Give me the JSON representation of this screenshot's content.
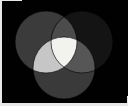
{
  "figure": {
    "name": "three-circle-venn-diagram",
    "background_color": "#010101",
    "page_color": "#ffffff",
    "border_color": "#e8e8e8",
    "width": 128,
    "height": 106
  },
  "chart_data": {
    "type": "venn",
    "title": "",
    "subtitle": "",
    "xlabel": "",
    "ylabel": "",
    "grid": false,
    "legend": "none",
    "background": "#010101",
    "sets": [
      {
        "id": "A",
        "label": "",
        "position": "top-left",
        "cx": 46,
        "cy": 42,
        "r": 31,
        "color": "#3b3b3b"
      },
      {
        "id": "B",
        "label": "",
        "position": "top-right",
        "cx": 82,
        "cy": 42,
        "r": 31,
        "color": "#141414"
      },
      {
        "id": "C",
        "label": "",
        "position": "bottom-center",
        "cx": 64,
        "cy": 68,
        "r": 31,
        "color": "#3a3a3a"
      }
    ],
    "regions": [
      {
        "id": "A",
        "sets": [
          "A"
        ],
        "label": "",
        "value": null,
        "color": "#3b3b3b"
      },
      {
        "id": "B",
        "sets": [
          "B"
        ],
        "label": "",
        "value": null,
        "color": "#141414"
      },
      {
        "id": "C",
        "sets": [
          "C"
        ],
        "label": "",
        "value": null,
        "color": "#3a3a3a"
      },
      {
        "id": "AB",
        "sets": [
          "A",
          "B"
        ],
        "label": "",
        "value": null,
        "color": "#4c4c4c"
      },
      {
        "id": "AC",
        "sets": [
          "A",
          "C"
        ],
        "label": "",
        "value": null,
        "color": "#c6c6c6"
      },
      {
        "id": "BC",
        "sets": [
          "B",
          "C"
        ],
        "label": "",
        "value": null,
        "color": "#565656"
      },
      {
        "id": "ABC",
        "sets": [
          "A",
          "B",
          "C"
        ],
        "label": "",
        "value": null,
        "color": "#f2f2ee"
      }
    ],
    "outline": {
      "stroke": "#000000",
      "stroke_width": 0.6
    }
  }
}
